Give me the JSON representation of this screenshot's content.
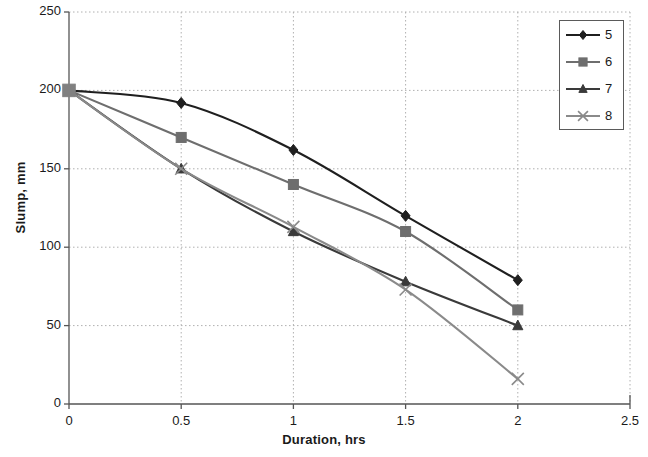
{
  "chart_data": {
    "type": "line",
    "title": "",
    "xlabel": "Duration, hrs",
    "ylabel": "Slump, mm",
    "x": [
      0,
      0.5,
      1,
      1.5,
      2
    ],
    "xlim": [
      0,
      2.5
    ],
    "ylim": [
      0,
      250
    ],
    "xticks": [
      "0",
      "0.5",
      "1",
      "1.5",
      "2",
      "2.5"
    ],
    "yticks": [
      "0",
      "50",
      "100",
      "150",
      "200",
      "250"
    ],
    "xtick_values": [
      0,
      0.5,
      1,
      1.5,
      2,
      2.5
    ],
    "ytick_values": [
      0,
      50,
      100,
      150,
      200,
      250
    ],
    "grid": true,
    "legend_position": "top-right",
    "series": [
      {
        "name": "5",
        "marker": "diamond",
        "color": "#1f1f1f",
        "values": [
          200,
          192,
          162,
          120,
          79
        ]
      },
      {
        "name": "6",
        "marker": "square",
        "color": "#6e6e6e",
        "values": [
          200,
          170,
          140,
          110,
          60
        ]
      },
      {
        "name": "7",
        "marker": "triangle",
        "color": "#3a3a3a",
        "values": [
          200,
          150,
          110,
          78,
          50
        ]
      },
      {
        "name": "8",
        "marker": "cross",
        "color": "#8a8a8a",
        "values": [
          200,
          150,
          113,
          73,
          16
        ]
      }
    ]
  },
  "legend": {
    "items": [
      {
        "label": "5"
      },
      {
        "label": "6"
      },
      {
        "label": "7"
      },
      {
        "label": "8"
      }
    ]
  },
  "colors": {
    "axis": "#555555",
    "grid": "#b0b0b0",
    "text": "#1a1a1a",
    "start_marker": "#808080"
  }
}
